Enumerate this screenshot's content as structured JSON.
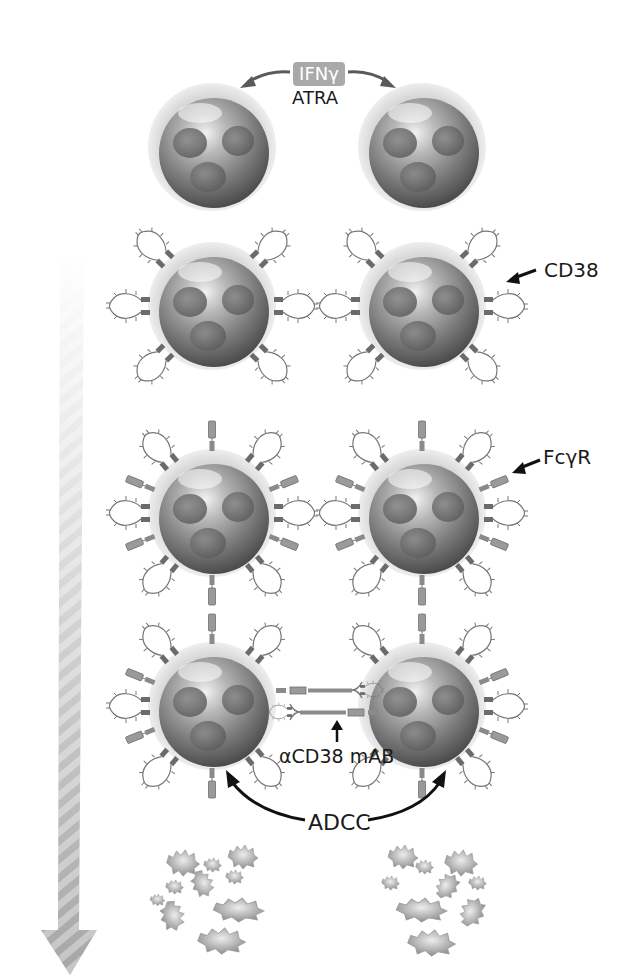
{
  "figure": {
    "type": "biological-mechanism-diagram"
  },
  "labels": {
    "stimulus_badge": "IFNγ",
    "stimulus_secondary": "ATRA",
    "receptor_cd38": "CD38",
    "receptor_fcgr": "FcγR",
    "antibody": "αCD38 mAB",
    "mechanism": "ADCC"
  },
  "stages": [
    {
      "id": "resting-cells",
      "row": 1,
      "cells": 2,
      "receptors": "none"
    },
    {
      "id": "cd38-upregulated",
      "row": 2,
      "cells": 2,
      "receptors": "CD38"
    },
    {
      "id": "fcgr-bound",
      "row": 3,
      "cells": 2,
      "receptors": "CD38 + FcγR"
    },
    {
      "id": "antibody-bridged",
      "row": 4,
      "cells": 2,
      "receptors": "CD38 + FcγR + αCD38 mAB"
    },
    {
      "id": "lysed-cells",
      "row": 5,
      "cells": 2,
      "receptors": "fragments"
    }
  ],
  "colors": {
    "badge_bg": "#a9a9a9",
    "text": "#1a1a1a",
    "cell_dark": "#4a4a4a",
    "cell_light": "#e6e6e6",
    "arrow_gradient_start": "#f4f4f4",
    "arrow_gradient_end": "#a8a8a8"
  }
}
